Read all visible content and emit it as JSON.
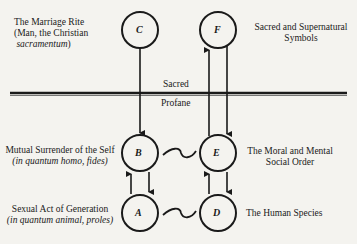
{
  "nodes": {
    "C": "C",
    "F": "F",
    "B": "B",
    "E": "E",
    "A": "A",
    "D": "D"
  },
  "labels": {
    "marriage_rite": {
      "line1": "The Marriage Rite",
      "line2": "(Man, the Christian",
      "line3": "sacramentum",
      "line3_close": ")"
    },
    "sacred_symbols": {
      "line1": "Sacred and Supernatural",
      "line2": "Symbols"
    },
    "sacred": "Sacred",
    "profane": "Profane",
    "mutual_surrender": {
      "line1": "Mutual Surrender of the Self",
      "line2": "(in quantum homo, fides)"
    },
    "moral_order": {
      "line1": "The Moral and Mental",
      "line2": "Social Order"
    },
    "sexual_act": {
      "line1": "Sexual Act of Generation",
      "line2": "(in quantum animal, proles)"
    },
    "human_species": "The Human Species"
  },
  "colors": {
    "ink": "#1a1a1a",
    "paper": "#f4f3ef"
  }
}
